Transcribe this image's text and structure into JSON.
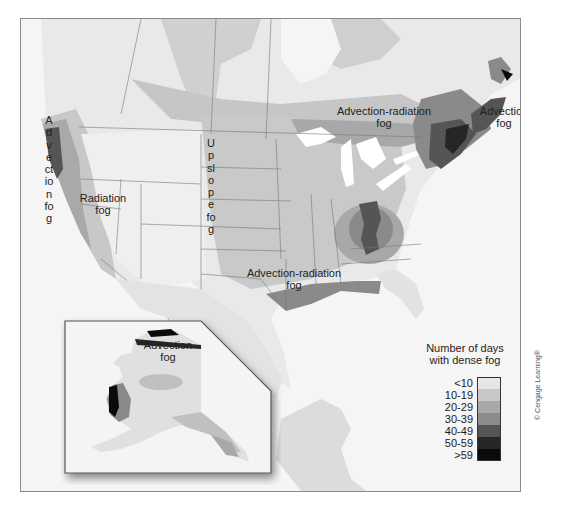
{
  "map": {
    "title": "Number of days with dense fog in North America",
    "labels": {
      "advection_fog_west": "Advection fog",
      "radiation_fog_line1": "Radiation",
      "radiation_fog_line2": "fog",
      "upslope_fog": "Upslope fog",
      "advection_radiation_ne_line1": "Advection-radiation",
      "advection_radiation_ne_line2": "fog",
      "advection_fog_ne_line1": "Advection",
      "advection_fog_ne_line2": "fog",
      "advection_radiation_south_line1": "Advection-radiation",
      "advection_radiation_south_line2": "fog",
      "alaska_advection_line1": "Advection",
      "alaska_advection_line2": "fog"
    },
    "inset": {
      "region": "Alaska"
    }
  },
  "legend": {
    "title_line1": "Number of days",
    "title_line2": "with dense fog",
    "classes": [
      {
        "label": "<10",
        "color": "#e6e6e6"
      },
      {
        "label": "10-19",
        "color": "#c8c8c8"
      },
      {
        "label": "20-29",
        "color": "#a9a9a9"
      },
      {
        "label": "30-39",
        "color": "#8b8b8b"
      },
      {
        "label": "40-49",
        "color": "#555555"
      },
      {
        "label": "50-59",
        "color": "#262626"
      },
      {
        "label": ">59",
        "color": "#0a0a0a"
      }
    ]
  },
  "credit": "© Cengage Learning®"
}
